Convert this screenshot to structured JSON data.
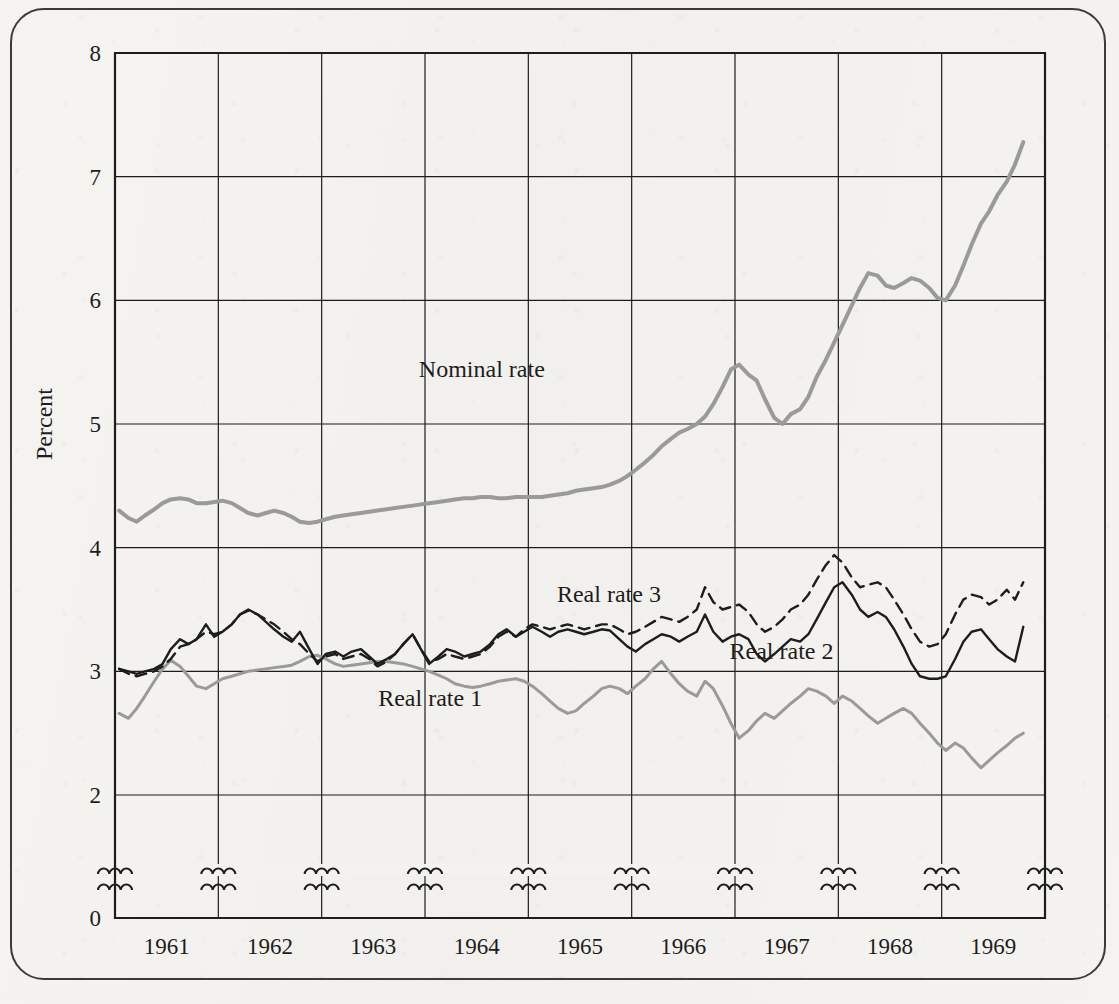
{
  "figure": {
    "frame_style": "rounded-rectangle-border",
    "background_color": "#f3f2ef",
    "ink_color": "#1d1d1d",
    "gray_ink_color": "#9a9a9a"
  },
  "axes": {
    "y_title": "Percent",
    "y_ticks": [
      "8",
      "7",
      "6",
      "5",
      "4",
      "3",
      "2",
      "0"
    ],
    "y_tick_values": [
      8,
      7,
      6,
      5,
      4,
      3,
      2,
      0
    ],
    "y_axis_break_between": [
      2,
      0
    ],
    "x_ticks": [
      "1961",
      "1962",
      "1963",
      "1964",
      "1965",
      "1966",
      "1967",
      "1968",
      "1969"
    ],
    "x_break_marks_count": 10
  },
  "series_labels": {
    "nominal": "Nominal rate",
    "real1": "Real rate 1",
    "real2": "Real rate 2",
    "real3": "Real rate 3"
  },
  "chart_data": {
    "type": "line",
    "title": "",
    "subtitle": "",
    "xlabel": "",
    "ylabel": "Percent",
    "xlim": [
      1960.5,
      1969.5
    ],
    "ylim": [
      2,
      8
    ],
    "y_axis_break": true,
    "y_axis_break_range": [
      0,
      2
    ],
    "grid": true,
    "legend": "inline-annotations",
    "x_tick_labels": [
      "1961",
      "1962",
      "1963",
      "1964",
      "1965",
      "1966",
      "1967",
      "1968",
      "1969"
    ],
    "y_tick_labels": [
      "0",
      "2",
      "3",
      "4",
      "5",
      "6",
      "7",
      "8"
    ],
    "annotations": [
      {
        "text": "Nominal rate",
        "x": 1964.05,
        "y": 5.38
      },
      {
        "text": "Real rate 3",
        "x": 1965.28,
        "y": 3.56
      },
      {
        "text": "Real rate 2",
        "x": 1966.95,
        "y": 3.1
      },
      {
        "text": "Real rate 1",
        "x": 1963.55,
        "y": 2.72
      }
    ],
    "series": [
      {
        "name": "Nominal rate",
        "style": "solid",
        "color": "#9a9a9a",
        "width": 4,
        "x": [
          1960.54,
          1960.63,
          1960.71,
          1960.79,
          1960.88,
          1960.96,
          1961.04,
          1961.13,
          1961.21,
          1961.29,
          1961.38,
          1961.46,
          1961.54,
          1961.63,
          1961.71,
          1961.79,
          1961.88,
          1961.96,
          1962.04,
          1962.13,
          1962.21,
          1962.29,
          1962.38,
          1962.46,
          1962.54,
          1962.63,
          1962.71,
          1962.79,
          1962.88,
          1962.96,
          1963.04,
          1963.13,
          1963.21,
          1963.29,
          1963.38,
          1963.46,
          1963.54,
          1963.63,
          1963.71,
          1963.79,
          1963.88,
          1963.96,
          1964.04,
          1964.13,
          1964.21,
          1964.29,
          1964.38,
          1964.46,
          1964.54,
          1964.63,
          1964.71,
          1964.79,
          1964.88,
          1964.96,
          1965.04,
          1965.13,
          1965.21,
          1965.29,
          1965.38,
          1965.46,
          1965.54,
          1965.63,
          1965.71,
          1965.79,
          1965.88,
          1965.96,
          1966.04,
          1966.13,
          1966.21,
          1966.29,
          1966.38,
          1966.46,
          1966.54,
          1966.63,
          1966.71,
          1966.79,
          1966.88,
          1966.96,
          1967.04,
          1967.13,
          1967.21,
          1967.29,
          1967.38,
          1967.46,
          1967.54,
          1967.63,
          1967.71,
          1967.79,
          1967.88,
          1967.96,
          1968.04,
          1968.13,
          1968.21,
          1968.29,
          1968.38,
          1968.46,
          1968.54,
          1968.63,
          1968.71,
          1968.79,
          1968.88,
          1968.96,
          1969.04,
          1969.13,
          1969.21,
          1969.29
        ],
        "y": [
          4.3,
          4.24,
          4.21,
          4.26,
          4.31,
          4.36,
          4.39,
          4.4,
          4.39,
          4.36,
          4.36,
          4.37,
          4.38,
          4.36,
          4.32,
          4.28,
          4.26,
          4.28,
          4.3,
          4.28,
          4.25,
          4.21,
          4.2,
          4.21,
          4.23,
          4.25,
          4.26,
          4.27,
          4.28,
          4.29,
          4.3,
          4.31,
          4.32,
          4.33,
          4.34,
          4.35,
          4.36,
          4.37,
          4.38,
          4.39,
          4.4,
          4.4,
          4.41,
          4.41,
          4.4,
          4.4,
          4.41,
          4.41,
          4.41,
          4.41,
          4.42,
          4.43,
          4.44,
          4.46,
          4.47,
          4.48,
          4.49,
          4.51,
          4.54,
          4.58,
          4.63,
          4.69,
          4.75,
          4.82,
          4.88,
          4.93,
          4.96,
          5.0,
          5.06,
          5.16,
          5.3,
          5.44,
          5.48,
          5.4,
          5.35,
          5.2,
          5.05,
          5.0,
          5.08,
          5.12,
          5.22,
          5.38,
          5.52,
          5.66,
          5.8,
          5.96,
          6.1,
          6.22,
          6.2,
          6.12,
          6.1,
          6.14,
          6.18,
          6.16,
          6.1,
          6.02,
          6.0,
          6.12,
          6.28,
          6.45,
          6.62,
          6.72,
          6.85,
          6.96,
          7.1,
          7.28
        ]
      },
      {
        "name": "Real rate 1",
        "style": "solid",
        "color": "#9a9a9a",
        "width": 3,
        "x": [
          1960.54,
          1960.63,
          1960.71,
          1960.79,
          1960.88,
          1960.96,
          1961.04,
          1961.13,
          1961.21,
          1961.29,
          1961.38,
          1961.46,
          1961.54,
          1961.63,
          1961.71,
          1961.79,
          1961.88,
          1961.96,
          1962.04,
          1962.13,
          1962.21,
          1962.29,
          1962.38,
          1962.46,
          1962.54,
          1962.63,
          1962.71,
          1962.79,
          1962.88,
          1962.96,
          1963.04,
          1963.13,
          1963.21,
          1963.29,
          1963.38,
          1963.46,
          1963.54,
          1963.63,
          1963.71,
          1963.79,
          1963.88,
          1963.96,
          1964.04,
          1964.13,
          1964.21,
          1964.29,
          1964.38,
          1964.46,
          1964.54,
          1964.63,
          1964.71,
          1964.79,
          1964.88,
          1964.96,
          1965.04,
          1965.13,
          1965.21,
          1965.29,
          1965.38,
          1965.46,
          1965.54,
          1965.63,
          1965.71,
          1965.79,
          1965.88,
          1965.96,
          1966.04,
          1966.13,
          1966.21,
          1966.29,
          1966.38,
          1966.46,
          1966.54,
          1966.63,
          1966.71,
          1966.79,
          1966.88,
          1966.96,
          1967.04,
          1967.13,
          1967.21,
          1967.29,
          1967.38,
          1967.46,
          1967.54,
          1967.63,
          1967.71,
          1967.79,
          1967.88,
          1967.96,
          1968.04,
          1968.13,
          1968.21,
          1968.29,
          1968.38,
          1968.46,
          1968.54,
          1968.63,
          1968.71,
          1968.79,
          1968.88,
          1968.96,
          1969.04,
          1969.13,
          1969.21,
          1969.29
        ],
        "y": [
          2.66,
          2.62,
          2.7,
          2.8,
          2.92,
          3.02,
          3.09,
          3.04,
          2.96,
          2.88,
          2.86,
          2.9,
          2.94,
          2.96,
          2.98,
          3.0,
          3.01,
          3.02,
          3.03,
          3.04,
          3.05,
          3.08,
          3.12,
          3.13,
          3.1,
          3.06,
          3.04,
          3.05,
          3.06,
          3.07,
          3.08,
          3.08,
          3.07,
          3.06,
          3.04,
          3.02,
          3.0,
          2.97,
          2.94,
          2.9,
          2.88,
          2.87,
          2.88,
          2.9,
          2.92,
          2.93,
          2.94,
          2.92,
          2.88,
          2.82,
          2.76,
          2.7,
          2.66,
          2.68,
          2.74,
          2.8,
          2.86,
          2.88,
          2.86,
          2.82,
          2.88,
          2.94,
          3.02,
          3.08,
          2.98,
          2.9,
          2.84,
          2.8,
          2.92,
          2.86,
          2.72,
          2.58,
          2.46,
          2.52,
          2.6,
          2.66,
          2.62,
          2.68,
          2.74,
          2.8,
          2.86,
          2.84,
          2.8,
          2.74,
          2.8,
          2.76,
          2.7,
          2.64,
          2.58,
          2.62,
          2.66,
          2.7,
          2.66,
          2.58,
          2.5,
          2.42,
          2.36,
          2.42,
          2.38,
          2.3,
          2.22,
          2.28,
          2.34,
          2.4,
          2.46,
          2.5
        ]
      },
      {
        "name": "Real rate 2",
        "style": "solid",
        "color": "#1d1d1d",
        "width": 2.4,
        "x": [
          1960.54,
          1960.63,
          1960.71,
          1960.79,
          1960.88,
          1960.96,
          1961.04,
          1961.13,
          1961.21,
          1961.29,
          1961.38,
          1961.46,
          1961.54,
          1961.63,
          1961.71,
          1961.79,
          1961.88,
          1961.96,
          1962.04,
          1962.13,
          1962.21,
          1962.29,
          1962.38,
          1962.46,
          1962.54,
          1962.63,
          1962.71,
          1962.79,
          1962.88,
          1962.96,
          1963.04,
          1963.13,
          1963.21,
          1963.29,
          1963.38,
          1963.46,
          1963.54,
          1963.63,
          1963.71,
          1963.79,
          1963.88,
          1963.96,
          1964.04,
          1964.13,
          1964.21,
          1964.29,
          1964.38,
          1964.46,
          1964.54,
          1964.63,
          1964.71,
          1964.79,
          1964.88,
          1964.96,
          1965.04,
          1965.13,
          1965.21,
          1965.29,
          1965.38,
          1965.46,
          1965.54,
          1965.63,
          1965.71,
          1965.79,
          1965.88,
          1965.96,
          1966.04,
          1966.13,
          1966.21,
          1966.29,
          1966.38,
          1966.46,
          1966.54,
          1966.63,
          1966.71,
          1966.79,
          1966.88,
          1966.96,
          1967.04,
          1967.13,
          1967.21,
          1967.29,
          1967.38,
          1967.46,
          1967.54,
          1967.63,
          1967.71,
          1967.79,
          1967.88,
          1967.96,
          1968.04,
          1968.13,
          1968.21,
          1968.29,
          1968.38,
          1968.46,
          1968.54,
          1968.63,
          1968.71,
          1968.79,
          1968.88,
          1968.96,
          1969.04,
          1969.13,
          1969.21,
          1969.29
        ],
        "y": [
          3.02,
          3.0,
          2.98,
          3.0,
          3.02,
          3.06,
          3.18,
          3.26,
          3.22,
          3.26,
          3.38,
          3.28,
          3.32,
          3.38,
          3.46,
          3.5,
          3.46,
          3.4,
          3.34,
          3.28,
          3.24,
          3.32,
          3.18,
          3.06,
          3.14,
          3.16,
          3.12,
          3.16,
          3.18,
          3.12,
          3.06,
          3.1,
          3.14,
          3.22,
          3.3,
          3.18,
          3.06,
          3.12,
          3.18,
          3.16,
          3.12,
          3.14,
          3.16,
          3.22,
          3.3,
          3.34,
          3.28,
          3.32,
          3.36,
          3.32,
          3.28,
          3.32,
          3.34,
          3.32,
          3.3,
          3.32,
          3.34,
          3.33,
          3.26,
          3.2,
          3.16,
          3.22,
          3.26,
          3.3,
          3.28,
          3.24,
          3.28,
          3.32,
          3.46,
          3.32,
          3.24,
          3.28,
          3.3,
          3.26,
          3.14,
          3.08,
          3.14,
          3.2,
          3.26,
          3.24,
          3.3,
          3.42,
          3.56,
          3.68,
          3.72,
          3.62,
          3.5,
          3.44,
          3.48,
          3.44,
          3.34,
          3.2,
          3.06,
          2.96,
          2.94,
          2.94,
          2.96,
          3.1,
          3.24,
          3.32,
          3.34,
          3.26,
          3.18,
          3.12,
          3.08,
          3.36
        ]
      },
      {
        "name": "Real rate 3",
        "style": "dashed",
        "color": "#1d1d1d",
        "width": 2.4,
        "x": [
          1960.54,
          1960.63,
          1960.71,
          1960.79,
          1960.88,
          1960.96,
          1961.04,
          1961.13,
          1961.21,
          1961.29,
          1961.38,
          1961.46,
          1961.54,
          1961.63,
          1961.71,
          1961.79,
          1961.88,
          1961.96,
          1962.04,
          1962.13,
          1962.21,
          1962.29,
          1962.38,
          1962.46,
          1962.54,
          1962.63,
          1962.71,
          1962.79,
          1962.88,
          1962.96,
          1963.04,
          1963.13,
          1963.21,
          1963.29,
          1963.38,
          1963.46,
          1963.54,
          1963.63,
          1963.71,
          1963.79,
          1963.88,
          1963.96,
          1964.04,
          1964.13,
          1964.21,
          1964.29,
          1964.38,
          1964.46,
          1964.54,
          1964.63,
          1964.71,
          1964.79,
          1964.88,
          1964.96,
          1965.04,
          1965.13,
          1965.21,
          1965.29,
          1965.38,
          1965.46,
          1965.54,
          1965.63,
          1965.71,
          1965.79,
          1965.88,
          1965.96,
          1966.04,
          1966.13,
          1966.21,
          1966.29,
          1966.38,
          1966.46,
          1966.54,
          1966.63,
          1966.71,
          1966.79,
          1966.88,
          1966.96,
          1967.04,
          1967.13,
          1967.21,
          1967.29,
          1967.38,
          1967.46,
          1967.54,
          1967.63,
          1967.71,
          1967.79,
          1967.88,
          1967.96,
          1968.04,
          1968.13,
          1968.21,
          1968.29,
          1968.38,
          1968.46,
          1968.54,
          1968.63,
          1968.71,
          1968.79,
          1968.88,
          1968.96,
          1969.04,
          1969.13,
          1969.21,
          1969.29
        ],
        "y": [
          3.02,
          2.98,
          2.96,
          2.98,
          3.0,
          3.04,
          3.1,
          3.2,
          3.22,
          3.26,
          3.32,
          3.3,
          3.32,
          3.38,
          3.46,
          3.49,
          3.46,
          3.42,
          3.38,
          3.32,
          3.26,
          3.22,
          3.14,
          3.08,
          3.12,
          3.14,
          3.1,
          3.12,
          3.14,
          3.1,
          3.04,
          3.08,
          3.14,
          3.22,
          3.3,
          3.18,
          3.08,
          3.1,
          3.14,
          3.12,
          3.1,
          3.12,
          3.14,
          3.2,
          3.28,
          3.32,
          3.28,
          3.34,
          3.38,
          3.36,
          3.34,
          3.36,
          3.38,
          3.36,
          3.34,
          3.36,
          3.38,
          3.38,
          3.34,
          3.3,
          3.32,
          3.36,
          3.4,
          3.44,
          3.42,
          3.4,
          3.44,
          3.5,
          3.68,
          3.56,
          3.5,
          3.52,
          3.54,
          3.48,
          3.38,
          3.32,
          3.36,
          3.42,
          3.5,
          3.54,
          3.62,
          3.74,
          3.86,
          3.94,
          3.88,
          3.76,
          3.68,
          3.7,
          3.72,
          3.68,
          3.58,
          3.46,
          3.34,
          3.24,
          3.2,
          3.22,
          3.3,
          3.46,
          3.58,
          3.62,
          3.6,
          3.54,
          3.58,
          3.66,
          3.58,
          3.72
        ]
      }
    ]
  }
}
